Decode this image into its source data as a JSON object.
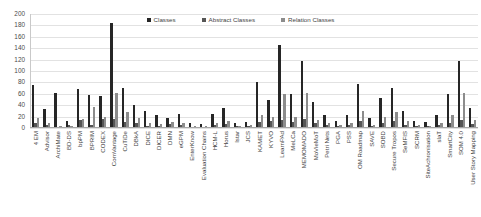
{
  "legend": {
    "position": "top-center",
    "entries": [
      {
        "label": "Classes",
        "color": "#262626",
        "icon": "legend-swatch"
      },
      {
        "label": "Abstract Classes",
        "color": "#555555",
        "icon": "legend-swatch"
      },
      {
        "label": "Relation Classes",
        "color": "#8c8c8c",
        "icon": "legend-swatch"
      }
    ]
  },
  "yaxis": {
    "ticks": [
      "200",
      "180",
      "160",
      "140",
      "120",
      "100",
      "80",
      "60",
      "40",
      "20",
      "0"
    ]
  },
  "chart_data": {
    "type": "bar",
    "title": "",
    "subtitle": "",
    "xlabel": "",
    "ylabel": "",
    "ylim": [
      0,
      200
    ],
    "ytick_step": 20,
    "grid": true,
    "legend_position": "top-center",
    "categories": [
      "4 EM",
      "Advisor",
      "ArchiMate",
      "BD-DS",
      "bpPM",
      "BPRIM",
      "CODEX",
      "ComVantage",
      "CuTiDe",
      "DBkA",
      "DICE",
      "DICER",
      "DMN",
      "eGPM",
      "EnterKnow",
      "Evaluation Chains",
      "HCM-L",
      "Horus",
      "Istar",
      "JCS",
      "KAMET",
      "KYVO",
      "LearnPAd",
      "MeLCa",
      "MEMOMADO",
      "MoVieMoT",
      "Petri Nets",
      "PGA",
      "PSS",
      "OM Roadmap",
      "SAVE",
      "SOBD",
      "Secure Tropos",
      "SeMFIS",
      "SCRM",
      "SiteAchronisation",
      "slaT",
      "SmartCity",
      "SOM 4.0",
      "User Story Mapping"
    ],
    "series": [
      {
        "name": "Classes",
        "color": "#262626",
        "values": [
          75,
          33,
          62,
          12,
          68,
          58,
          57,
          185,
          70,
          40,
          30,
          22,
          18,
          25,
          8,
          7,
          24,
          35,
          9,
          10,
          80,
          50,
          145,
          60,
          118,
          45,
          22,
          12,
          22,
          77,
          18,
          52,
          70,
          30,
          12,
          10,
          22,
          60,
          118,
          35
        ]
      },
      {
        "name": "Abstract Classes",
        "color": "#555555",
        "values": [
          9,
          5,
          0,
          6,
          14,
          6,
          16,
          15,
          10,
          8,
          4,
          3,
          7,
          5,
          2,
          2,
          6,
          7,
          3,
          4,
          10,
          12,
          14,
          10,
          16,
          8,
          5,
          4,
          5,
          12,
          4,
          9,
          12,
          6,
          3,
          3,
          5,
          9,
          14,
          7
        ]
      },
      {
        "name": "Relation Classes",
        "color": "#8c8c8c",
        "values": [
          17,
          8,
          3,
          3,
          15,
          36,
          20,
          62,
          28,
          17,
          9,
          7,
          10,
          8,
          3,
          3,
          9,
          13,
          4,
          5,
          22,
          20,
          60,
          20,
          62,
          14,
          8,
          5,
          8,
          30,
          6,
          20,
          28,
          12,
          5,
          4,
          8,
          22,
          62,
          14
        ]
      }
    ]
  }
}
